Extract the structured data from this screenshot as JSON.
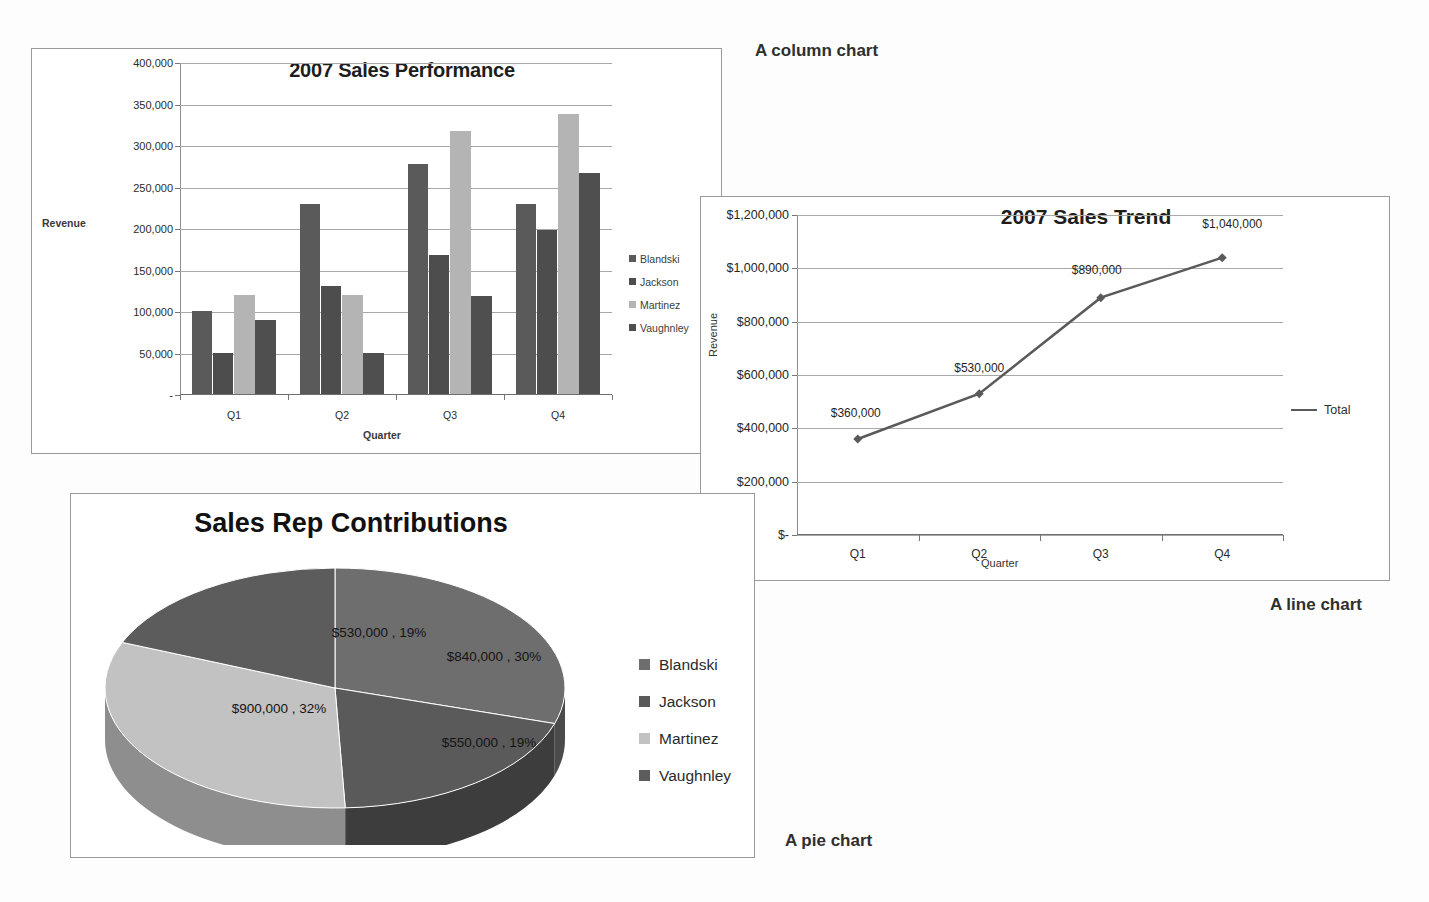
{
  "annotations": {
    "column": "A column chart",
    "line": "A line chart",
    "pie": "A pie chart"
  },
  "palette": {
    "series1": "#5a5a5a",
    "series2": "#4d4d4d",
    "series3": "#b4b4b4",
    "series4": "#4f4f4f",
    "pie_blandski": "#6e6e6e",
    "pie_jackson": "#5a5a5a",
    "pie_martinez": "#c2c2c2",
    "pie_vaughnley": "#5c5c5c",
    "line_color": "#5a5a5a",
    "gridline": "#a8a8a8"
  },
  "column_chart": {
    "title": "2007 Sales Performance",
    "ylabel": "Revenue",
    "xlabel": "Quarter",
    "legend": [
      "Blandski",
      "Jackson",
      "Martinez",
      "Vaughnley"
    ],
    "yticks": [
      "400,000",
      "350,000",
      "300,000",
      "250,000",
      "200,000",
      "150,000",
      "100,000",
      "50,000",
      "-"
    ],
    "xticks": [
      "Q1",
      "Q2",
      "Q3",
      "Q4"
    ]
  },
  "line_chart": {
    "title": "2007 Sales Trend",
    "ylabel": "Revenue",
    "xlabel": "Quarter",
    "legend": [
      "Total"
    ],
    "yticks": [
      "$1,200,000",
      "$1,000,000",
      "$800,000",
      "$600,000",
      "$400,000",
      "$200,000",
      "$-"
    ],
    "xticks": [
      "Q1",
      "Q2",
      "Q3",
      "Q4"
    ],
    "point_labels": [
      "$360,000",
      "$530,000",
      "$890,000",
      "$1,040,000"
    ]
  },
  "pie_chart": {
    "title": "Sales Rep Contributions",
    "legend": [
      "Blandski",
      "Jackson",
      "Martinez",
      "Vaughnley"
    ],
    "slice_labels": [
      "$840,000 , 30%",
      "$550,000 , 19%",
      "$900,000 , 32%",
      "$530,000 , 19%"
    ]
  },
  "chart_data": [
    {
      "type": "bar",
      "title": "2007 Sales Performance",
      "xlabel": "Quarter",
      "ylabel": "Revenue",
      "categories": [
        "Q1",
        "Q2",
        "Q3",
        "Q4"
      ],
      "series": [
        {
          "name": "Blandski",
          "values": [
            100000,
            229000,
            277000,
            229000
          ]
        },
        {
          "name": "Jackson",
          "values": [
            50000,
            130000,
            168000,
            198000
          ]
        },
        {
          "name": "Martinez",
          "values": [
            119000,
            119000,
            317000,
            337000
          ]
        },
        {
          "name": "Vaughnley",
          "values": [
            89000,
            50000,
            118000,
            266000
          ]
        }
      ],
      "ylim": [
        0,
        400000
      ],
      "ytick_values": [
        0,
        50000,
        100000,
        150000,
        200000,
        250000,
        300000,
        350000,
        400000
      ],
      "grid": true,
      "legend_position": "right"
    },
    {
      "type": "line",
      "title": "2007 Sales Trend",
      "xlabel": "Quarter",
      "ylabel": "Revenue",
      "x": [
        "Q1",
        "Q2",
        "Q3",
        "Q4"
      ],
      "series": [
        {
          "name": "Total",
          "values": [
            360000,
            530000,
            890000,
            1040000
          ]
        }
      ],
      "data_labels": [
        "$360,000",
        "$530,000",
        "$890,000",
        "$1,040,000"
      ],
      "ylim": [
        0,
        1200000
      ],
      "ytick_values": [
        0,
        200000,
        400000,
        600000,
        800000,
        1000000,
        1200000
      ],
      "grid": true,
      "legend_position": "right"
    },
    {
      "type": "pie",
      "title": "Sales Rep Contributions",
      "labels": [
        "Blandski",
        "Jackson",
        "Martinez",
        "Vaughnley"
      ],
      "values": [
        840000,
        550000,
        900000,
        530000
      ],
      "percentages": [
        30,
        19,
        32,
        19
      ],
      "data_labels": [
        "$840,000 , 30%",
        "$550,000 , 19%",
        "$900,000 , 32%",
        "$530,000 , 19%"
      ],
      "three_d": true,
      "legend_position": "right"
    }
  ]
}
